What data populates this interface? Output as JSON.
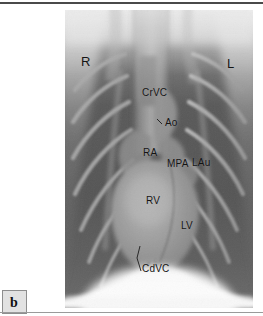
{
  "figure": {
    "panel_letter": "b",
    "modality": "radiograph",
    "view": "ventrodorsal-thoracic",
    "orientation_labels": {
      "right": "R",
      "left": "L"
    },
    "annotations": [
      {
        "id": "crvc",
        "text": "CrVC",
        "x": 142,
        "y": 88,
        "leader": false
      },
      {
        "id": "ao",
        "text": "Ao",
        "x": 163,
        "y": 118,
        "leader": true
      },
      {
        "id": "ra",
        "text": "RA",
        "x": 143,
        "y": 148,
        "leader": false
      },
      {
        "id": "mpa",
        "text": "MPA",
        "x": 167,
        "y": 159,
        "leader": false
      },
      {
        "id": "lau",
        "text": "LAu",
        "x": 192,
        "y": 158,
        "leader": false
      },
      {
        "id": "rv",
        "text": "RV",
        "x": 146,
        "y": 196,
        "leader": false
      },
      {
        "id": "lv",
        "text": "LV",
        "x": 181,
        "y": 221,
        "leader": false
      },
      {
        "id": "cdvc",
        "text": "CdVC",
        "x": 142,
        "y": 264,
        "leader": true
      }
    ],
    "side_labels": [
      {
        "id": "right",
        "text": "R",
        "x": 81,
        "y": 55
      },
      {
        "id": "left",
        "text": "L",
        "x": 227,
        "y": 57
      }
    ],
    "colors": {
      "lung_field": "#585858",
      "soft_tissue": "#6f6f6f",
      "heart": "#8c8c8c",
      "bone": "#b5b5b5",
      "diaphragm": "#f2f2f2",
      "spine_bright": "#d8d8d8",
      "label_text": "#141414",
      "panel_box_fill": "#e2e2e2",
      "panel_box_border": "#8e8e8e",
      "page_background": "#ffffff",
      "rule": "#4a4a4a"
    }
  }
}
